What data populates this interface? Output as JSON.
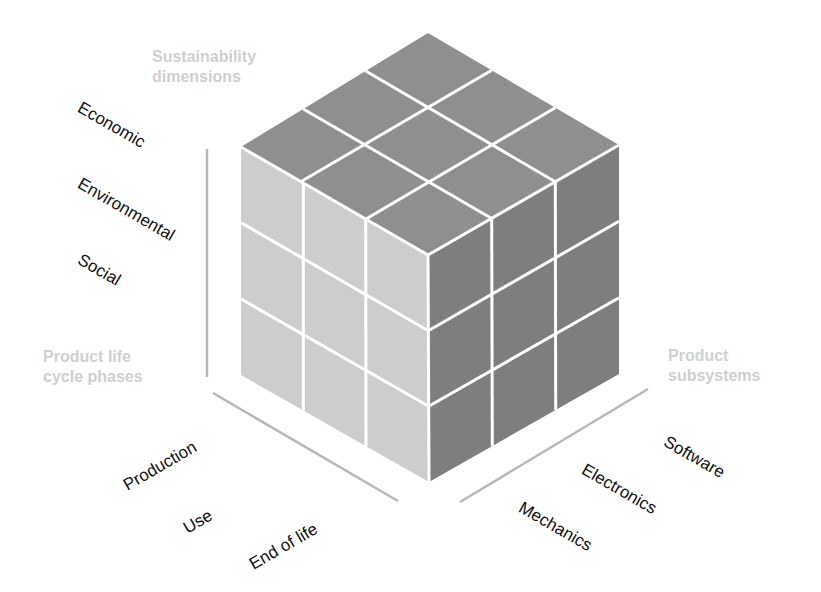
{
  "diagram": {
    "type": "3x3x3 cube",
    "colors": {
      "top_face": "#8f8f8f",
      "left_face": "#cdcdcd",
      "right_face": "#7e7e7e",
      "grid_lines": "#ffffff",
      "axis_lines": "#b8b8b8",
      "axis_titles": "#cfcfcf",
      "labels": "#111111"
    },
    "axes": {
      "vertical": {
        "title_line1": "Sustainability",
        "title_line2": "dimensions",
        "labels": [
          "Economic",
          "Environmental",
          "Social"
        ]
      },
      "left_depth": {
        "title_line1": "Product life",
        "title_line2": "cycle phases",
        "labels": [
          "Production",
          "Use",
          "End of life"
        ]
      },
      "right_depth": {
        "title_line1": "Product",
        "title_line2": "subsystems",
        "labels": [
          "Software",
          "Electronics",
          "Mechanics"
        ]
      }
    }
  }
}
